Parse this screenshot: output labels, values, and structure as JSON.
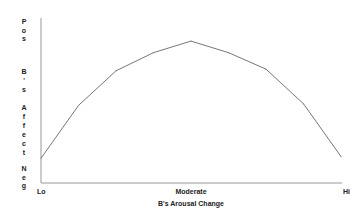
{
  "chart_data": {
    "type": "line",
    "title": "",
    "xlabel": "B's Arousal Change",
    "ylabel": "B's Affect",
    "x": [
      0,
      1,
      2,
      3,
      4,
      5,
      6,
      7,
      8
    ],
    "xlim": [
      0,
      8
    ],
    "ylim": [
      0,
      100
    ],
    "x_tick_labels": [
      {
        "x": 0,
        "label": "Lo"
      },
      {
        "x": 4,
        "label": "Moderate"
      },
      {
        "x": 8,
        "label": "Hi"
      }
    ],
    "y_tick_labels": [
      {
        "y": 100,
        "label": "Pos"
      },
      {
        "y": 0,
        "label": "Neg"
      }
    ],
    "series": [
      {
        "name": "B's Affect",
        "values": [
          15,
          47,
          68,
          79,
          86,
          79,
          69,
          48,
          16
        ],
        "color": "#777777"
      }
    ],
    "grid": false,
    "legend": "none"
  }
}
